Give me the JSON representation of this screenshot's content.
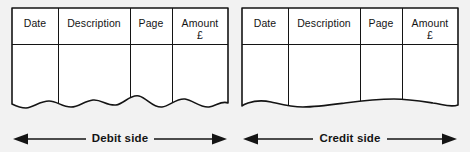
{
  "figure": {
    "name": "ledger-two-sided-account",
    "background_color": "#f2f2f2",
    "line_color": "#141414",
    "paper_color": "#ffffff"
  },
  "table": {
    "columns": [
      "Date",
      "Description",
      "Page",
      "Amount"
    ],
    "amount_currency_symbol": "£",
    "sides": [
      {
        "key": "debit",
        "label": "Debit side",
        "headers": [
          {
            "label": "Date",
            "sub": ""
          },
          {
            "label": "Description",
            "sub": ""
          },
          {
            "label": "Page",
            "sub": ""
          },
          {
            "label": "Amount",
            "sub": "£"
          }
        ]
      },
      {
        "key": "credit",
        "label": "Credit side",
        "headers": [
          {
            "label": "Date",
            "sub": ""
          },
          {
            "label": "Description",
            "sub": ""
          },
          {
            "label": "Page",
            "sub": ""
          },
          {
            "label": "Amount",
            "sub": "£"
          }
        ]
      }
    ]
  },
  "annotations": {
    "debit_label": "Debit side",
    "credit_label": "Credit side",
    "left_arrow": "left-arrow-icon",
    "right_arrow": "right-arrow-icon"
  }
}
